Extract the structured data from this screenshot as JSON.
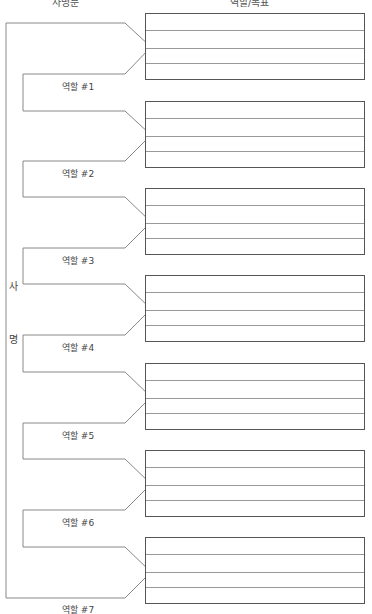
{
  "header": {
    "left_label": "사명문",
    "right_label": "역할/목표"
  },
  "mission_side": {
    "chars": [
      "사",
      "명"
    ]
  },
  "roles": [
    {
      "label": "역할 #1",
      "box_top": 13
    },
    {
      "label": "역할 #2",
      "box_top": 101
    },
    {
      "label": "역할 #3",
      "box_top": 188
    },
    {
      "label": "역할 #4",
      "box_top": 275
    },
    {
      "label": "역할 #5",
      "box_top": 363
    },
    {
      "label": "역할 #6",
      "box_top": 450
    },
    {
      "label": "역할 #7",
      "box_top": 537
    }
  ],
  "colors": {
    "line": "#888888",
    "box_border": "#555555",
    "text": "#444444"
  }
}
